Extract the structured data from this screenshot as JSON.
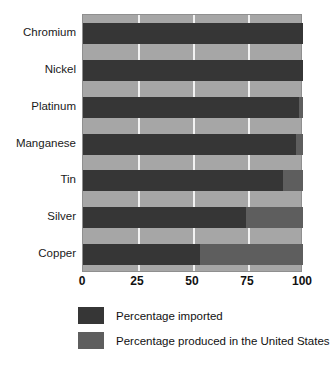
{
  "chart_data": {
    "type": "bar",
    "orientation": "horizontal",
    "stacked": true,
    "title": "",
    "xlabel": "",
    "ylabel": "",
    "xlim": [
      0,
      100
    ],
    "grid": true,
    "legend_position": "bottom",
    "categories": [
      "Chromium",
      "Nickel",
      "Platinum",
      "Manganese",
      "Tin",
      "Silver",
      "Copper"
    ],
    "x_ticks": [
      0,
      25,
      50,
      75,
      100
    ],
    "x_tick_labels": [
      "0",
      "25",
      "50",
      "75",
      "100"
    ],
    "series": [
      {
        "name": "Percentage imported",
        "color": "#363636",
        "values": [
          100,
          100,
          98,
          97,
          91,
          74,
          53
        ]
      },
      {
        "name": "Percentage produced in the United States",
        "color": "#5e5e5e",
        "values": [
          0,
          0,
          2,
          3,
          9,
          26,
          47
        ]
      }
    ],
    "plot_background": "#a6a6a6",
    "gridline_color": "#f2f2f2"
  },
  "legend": {
    "items": [
      {
        "label": "Percentage imported",
        "swatch": "imported"
      },
      {
        "label": "Percentage produced in the United States",
        "swatch": "domestic"
      }
    ]
  }
}
